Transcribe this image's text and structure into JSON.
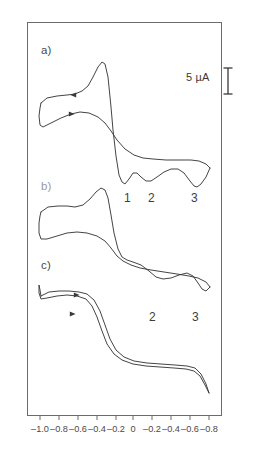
{
  "figure": {
    "type": "cyclic-voltammogram",
    "background_color": "#ffffff",
    "line_color": "#3a3a3a",
    "frame_color": "#6b6b6b"
  },
  "scale_bar": {
    "label": "5 µA",
    "value": 5,
    "unit": "µA",
    "icon": "i-beam-scale-icon"
  },
  "panels": [
    {
      "letter": "a)",
      "peak_labels": [
        "1",
        "2",
        "3"
      ]
    },
    {
      "letter": "b)",
      "peak_labels": [
        "2",
        "3"
      ]
    },
    {
      "letter": "c)",
      "peak_labels": []
    }
  ],
  "peak_markers": {
    "a": [
      {
        "label": "1",
        "x": 124,
        "y": 191
      },
      {
        "label": "2",
        "x": 148,
        "y": 191
      },
      {
        "label": "3",
        "x": 191,
        "y": 191
      }
    ],
    "b": [
      {
        "label": "2",
        "x": 149,
        "y": 310
      },
      {
        "label": "3",
        "x": 192,
        "y": 310
      }
    ]
  },
  "chart_data": {
    "type": "line",
    "title": "",
    "xlabel": "",
    "ylabel": "",
    "xlim": [
      -1.0,
      -0.8
    ],
    "grid": false,
    "legend": "none",
    "xticklabels": [
      "-1.0",
      "-0.8",
      "-0.6",
      "-0.4",
      "-0.2",
      "0",
      "-0.2",
      "-0.4",
      "-0.6",
      "-0.8"
    ],
    "xtick_px": [
      40,
      59,
      78,
      97,
      116,
      133,
      152,
      171,
      190,
      209
    ],
    "current_scale": {
      "label": "5 µA",
      "value": 5,
      "unit": "µA"
    },
    "series": [
      {
        "name": "a)",
        "annotations": [
          "1",
          "2",
          "3"
        ],
        "forward_path": "M 40,102 L 46,97 L 56,95 L 66,94 L 74,93 L 81,90 L 87,85 L 92,76 L 97,66 L 101,61 L 104,63 L 107,76 L 110,106 L 112,129 L 115,155 L 118,174 L 121,181 L 124,183 L 128,178 L 132,172 L 136,172 L 140,176 L 145,180 L 150,180 L 156,176 L 163,171 L 170,168 L 177,168 L 183,172 L 189,180 L 193,185 L 196,186 L 200,183 L 205,176 L 209,167",
        "reverse_path": "M 209,167 L 205,163 L 198,160 L 190,159 L 178,159 L 165,159 L 152,158 L 142,157 L 133,154 L 124,148 L 116,139 L 110,130 L 104,122 L 97,116 L 88,112 L 79,111 L 70,113 L 60,117 L 50,122 L 42,126 L 39,124 L 38,115 L 39,107 L 40,102",
        "arrows": [
          {
            "x": 72,
            "y": 94,
            "dir": "left"
          },
          {
            "x": 71,
            "y": 113,
            "dir": "right"
          }
        ]
      },
      {
        "name": "b)",
        "annotations": [
          "2",
          "3"
        ],
        "forward_path": "M 40,211 L 47,206 L 57,205 L 66,205 L 74,206 L 82,204 L 89,198 L 95,191 L 100,187 L 104,189 L 107,197 L 110,214 L 113,232 L 117,248 L 121,256 L 126,259 L 132,261 L 140,264 L 148,270 L 155,276 L 162,278 L 170,277 L 178,274 L 186,272 L 192,275 L 197,282 L 201,288 L 205,290 L 209,286",
        "reverse_path": "M 209,286 L 205,281 L 197,277 L 188,275 L 176,273 L 163,271 L 150,269 L 139,267 L 130,264 L 122,260 L 116,255 L 110,247 L 104,240 L 96,235 L 86,232 L 76,231 L 66,232 L 56,235 L 46,238 L 40,238 L 38,232 L 38,222 L 39,215 L 40,211"
      },
      {
        "name": "c)",
        "annotations": [],
        "forward_path": "M 40,295 L 48,291 L 58,290 L 68,290 L 78,291 L 86,293 L 93,299 L 99,310 L 104,324 L 109,338 L 115,349 L 123,356 L 133,360 L 146,362 L 160,363 L 174,364 L 186,365 L 194,367 L 200,373 L 205,383 L 208,392",
        "reverse_path": "M 208,392 L 204,384 L 199,375 L 193,370 L 185,368 L 173,367 L 159,366 L 145,365 L 132,363 L 121,359 L 113,353 L 106,343 L 101,330 L 96,316 L 91,305 L 85,298 L 76,295 L 66,294 L 56,295 L 46,297 L 40,298 L 38,292 L 38,284 L 39,289 L 40,295",
        "arrows": [
          {
            "x": 76,
            "y": 294,
            "dir": "right"
          },
          {
            "x": 72,
            "y": 313,
            "dir": "right"
          }
        ]
      }
    ]
  }
}
